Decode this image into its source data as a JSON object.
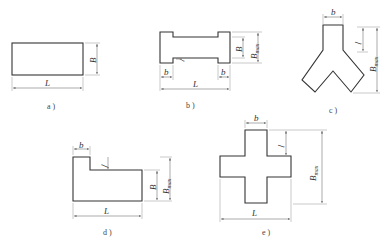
{
  "figures": [
    {
      "id": "a",
      "caption": "a )",
      "shape": "rectangle",
      "labels": {
        "L": "L",
        "B": "B"
      }
    },
    {
      "id": "b",
      "caption": "b )",
      "shape": "dumbbell",
      "labels": {
        "L": "L",
        "b_left": "b",
        "b_right": "b",
        "l": "l",
        "B": "B",
        "Bmax": "B",
        "Bmax_sub": "max"
      }
    },
    {
      "id": "c",
      "caption": "c )",
      "shape": "Y-shape",
      "labels": {
        "b": "b",
        "l": "l",
        "Bmax": "B",
        "Bmax_sub": "max"
      }
    },
    {
      "id": "d",
      "caption": "d )",
      "shape": "L-step",
      "labels": {
        "b": "b",
        "l": "l",
        "L": "L",
        "B": "B",
        "Bmax": "B",
        "Bmax_sub": "max"
      }
    },
    {
      "id": "e",
      "caption": "e )",
      "shape": "cross",
      "labels": {
        "b": "b",
        "l": "l",
        "L": "L",
        "Bmax": "B",
        "Bmax_sub": "max"
      }
    }
  ]
}
